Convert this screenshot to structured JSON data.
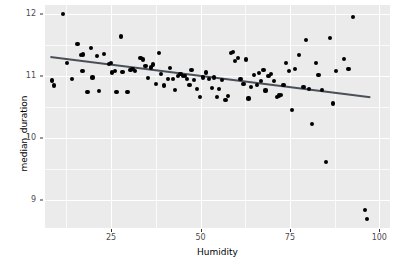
{
  "chart_data": {
    "type": "scatter",
    "title": "",
    "subtitle": "",
    "xlabel": "Humidity",
    "ylabel": "median_duration",
    "xlim": [
      6.5,
      103
    ],
    "ylim": [
      8.55,
      12.15
    ],
    "x_ticks": [
      25,
      50,
      75,
      100
    ],
    "x_tick_labels": [
      "25",
      "50",
      "75",
      "100"
    ],
    "y_ticks": [
      9,
      10,
      11,
      12
    ],
    "y_tick_labels": [
      "9",
      "10",
      "11",
      "12"
    ],
    "x_minor_ticks": [
      12.5,
      37.5,
      62.5,
      87.5
    ],
    "y_minor_ticks": [
      8.5,
      9.5,
      10.5,
      11.5
    ],
    "grid": true,
    "legend": "none",
    "panel_background": "#ebebeb",
    "grid_color": "#ffffff",
    "point_color": "#000000",
    "line_color": "#4a5058",
    "series": [
      {
        "name": "median_duration vs Humidity",
        "marker": "filled-circle",
        "points": [
          [
            8.4,
            10.93
          ],
          [
            9.0,
            10.85
          ],
          [
            11.5,
            12.0
          ],
          [
            12.7,
            11.21
          ],
          [
            14.1,
            10.96
          ],
          [
            15.6,
            11.52
          ],
          [
            16.5,
            11.34
          ],
          [
            17.2,
            11.35
          ],
          [
            17.0,
            11.09
          ],
          [
            18.4,
            10.75
          ],
          [
            19.3,
            11.45
          ],
          [
            19.8,
            10.98
          ],
          [
            21.0,
            11.33
          ],
          [
            21.6,
            10.76
          ],
          [
            23.1,
            11.36
          ],
          [
            24.4,
            11.2
          ],
          [
            25.0,
            11.22
          ],
          [
            25.3,
            11.06
          ],
          [
            26.0,
            11.08
          ],
          [
            26.5,
            10.74
          ],
          [
            27.8,
            11.64
          ],
          [
            28.2,
            11.07
          ],
          [
            29.6,
            10.74
          ],
          [
            30.4,
            11.1
          ],
          [
            31.0,
            11.12
          ],
          [
            31.6,
            11.09
          ],
          [
            33.2,
            11.3
          ],
          [
            33.9,
            11.27
          ],
          [
            34.6,
            11.16
          ],
          [
            35.4,
            10.97
          ],
          [
            36.2,
            11.14
          ],
          [
            36.8,
            11.19
          ],
          [
            37.6,
            10.87
          ],
          [
            38.4,
            11.38
          ],
          [
            39.0,
            11.04
          ],
          [
            39.7,
            10.85
          ],
          [
            40.8,
            10.96
          ],
          [
            41.5,
            11.13
          ],
          [
            42.3,
            10.95
          ],
          [
            42.9,
            10.78
          ],
          [
            43.6,
            11.01
          ],
          [
            44.4,
            11.03
          ],
          [
            45.0,
            11.01
          ],
          [
            45.7,
            11.0
          ],
          [
            46.3,
            10.96
          ],
          [
            46.9,
            10.86
          ],
          [
            47.5,
            11.1
          ],
          [
            48.2,
            10.94
          ],
          [
            49.0,
            10.8
          ],
          [
            49.8,
            10.67
          ],
          [
            50.8,
            10.98
          ],
          [
            51.5,
            11.06
          ],
          [
            52.3,
            10.96
          ],
          [
            53.1,
            10.81
          ],
          [
            53.8,
            10.98
          ],
          [
            54.5,
            10.66
          ],
          [
            55.2,
            10.79
          ],
          [
            56.0,
            10.94
          ],
          [
            57.0,
            10.62
          ],
          [
            57.8,
            10.68
          ],
          [
            58.6,
            11.37
          ],
          [
            59.0,
            11.39
          ],
          [
            59.6,
            11.24
          ],
          [
            60.4,
            11.3
          ],
          [
            61.2,
            10.96
          ],
          [
            62.0,
            10.87
          ],
          [
            62.8,
            11.27
          ],
          [
            63.4,
            10.64
          ],
          [
            64.2,
            10.82
          ],
          [
            65.0,
            11.02
          ],
          [
            65.8,
            10.86
          ],
          [
            66.4,
            11.05
          ],
          [
            66.9,
            10.92
          ],
          [
            67.6,
            11.1
          ],
          [
            68.2,
            10.77
          ],
          [
            69.0,
            11.0
          ],
          [
            69.8,
            11.04
          ],
          [
            70.6,
            10.92
          ],
          [
            71.4,
            10.67
          ],
          [
            72.0,
            10.69
          ],
          [
            72.6,
            10.7
          ],
          [
            73.2,
            10.86
          ],
          [
            74.0,
            11.22
          ],
          [
            74.8,
            11.08
          ],
          [
            75.6,
            10.45
          ],
          [
            76.4,
            11.12
          ],
          [
            77.5,
            11.34
          ],
          [
            78.8,
            10.82
          ],
          [
            79.6,
            11.58
          ],
          [
            80.4,
            10.8
          ],
          [
            81.2,
            10.23
          ],
          [
            82.4,
            11.21
          ],
          [
            83.0,
            11.02
          ],
          [
            84.0,
            10.78
          ],
          [
            85.0,
            9.62
          ],
          [
            86.2,
            11.62
          ],
          [
            87.0,
            10.56
          ],
          [
            88.0,
            11.08
          ],
          [
            90.2,
            11.28
          ],
          [
            91.4,
            11.12
          ],
          [
            92.6,
            11.95
          ],
          [
            96.0,
            8.84
          ],
          [
            96.6,
            8.7
          ]
        ]
      }
    ],
    "trend_line": {
      "name": "linear fit",
      "x_start": 8.0,
      "y_start": 11.31,
      "x_end": 97.5,
      "y_end": 10.66,
      "color": "#4a5058",
      "width": 2.0
    }
  }
}
